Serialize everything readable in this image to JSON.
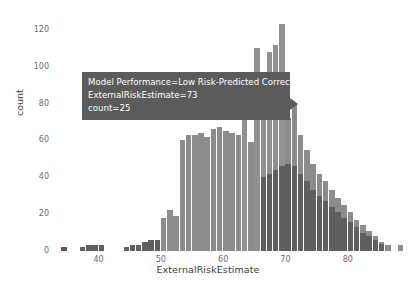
{
  "chart_data": {
    "type": "bar",
    "subtype": "overlapping-histogram",
    "title": "",
    "xlabel": "ExternalRiskEstimate",
    "ylabel": "count",
    "xlim": [
      33,
      90
    ],
    "ylim": [
      0,
      128
    ],
    "xticks": [
      40,
      50,
      60,
      70,
      80
    ],
    "yticks": [
      0,
      20,
      40,
      60,
      80,
      100,
      120
    ],
    "grid": false,
    "legend_position": "none",
    "bin_width": 1,
    "x": [
      34,
      35,
      36,
      37,
      38,
      39,
      40,
      41,
      42,
      43,
      44,
      45,
      46,
      47,
      48,
      49,
      50,
      51,
      52,
      53,
      54,
      55,
      56,
      57,
      58,
      59,
      60,
      61,
      62,
      63,
      64,
      65,
      66,
      67,
      68,
      69,
      70,
      71,
      72,
      73,
      74,
      75,
      76,
      77,
      78,
      79,
      80,
      81,
      82,
      83,
      84,
      85,
      86,
      87,
      88
    ],
    "series": [
      {
        "name": "Low Risk-Predicted Correctly",
        "color": "#8a8a8a",
        "values": [
          0,
          0,
          0,
          0,
          0,
          0,
          0,
          0,
          0,
          0,
          0,
          0,
          0,
          0,
          0,
          0,
          0,
          0,
          0,
          0,
          0,
          1,
          1,
          2,
          2,
          3,
          4,
          5,
          7,
          9,
          12,
          16,
          20,
          26,
          34,
          43,
          57,
          72,
          88,
          112,
          95,
          88,
          74,
          66,
          58,
          50,
          44,
          38,
          31,
          25,
          18,
          12,
          8,
          3,
          1
        ]
      },
      {
        "name": "High Risk-Predicted Correctly",
        "color": "#646464",
        "values": [
          1,
          0,
          0,
          1,
          1,
          2,
          2,
          1,
          1,
          1,
          2,
          2,
          2,
          4,
          5,
          8,
          12,
          14,
          16,
          22,
          60,
          62,
          63,
          64,
          62,
          65,
          66,
          65,
          64,
          62,
          60,
          58,
          57,
          58,
          55,
          52,
          50,
          46,
          40,
          35,
          30,
          26,
          22,
          18,
          15,
          12,
          10,
          8,
          6,
          4,
          3,
          2,
          1,
          1,
          2
        ]
      }
    ],
    "bars_rendered": [
      {
        "x": 34,
        "h": 2,
        "shade": "dark"
      },
      {
        "x": 37,
        "h": 2,
        "shade": "dark"
      },
      {
        "x": 38,
        "h": 3,
        "shade": "dark"
      },
      {
        "x": 39,
        "h": 3,
        "shade": "dark"
      },
      {
        "x": 40,
        "h": 3,
        "shade": "dark"
      },
      {
        "x": 44,
        "h": 2,
        "shade": "dark"
      },
      {
        "x": 45,
        "h": 3,
        "shade": "dark"
      },
      {
        "x": 46,
        "h": 3,
        "shade": "dark"
      },
      {
        "x": 47,
        "h": 5,
        "shade": "dark"
      },
      {
        "x": 48,
        "h": 6,
        "shade": "dark"
      },
      {
        "x": 49,
        "h": 6,
        "shade": "dark"
      },
      {
        "x": 50,
        "h": 6,
        "shade": "dark"
      },
      {
        "x": 51,
        "h": 8,
        "shade": "dark"
      },
      {
        "x": 52,
        "h": 6,
        "shade": "dark"
      },
      {
        "x": 53,
        "h": 6,
        "shade": "dark"
      },
      {
        "x": 54,
        "h": 7,
        "shade": "dark"
      },
      {
        "x": 55,
        "h": 8,
        "shade": "dark"
      },
      {
        "x": 56,
        "h": 9,
        "shade": "dark"
      },
      {
        "x": 57,
        "h": 10,
        "shade": "dark"
      },
      {
        "x": 58,
        "h": 12,
        "shade": "dark"
      },
      {
        "x": 50,
        "h": 18,
        "shade": "mid"
      },
      {
        "x": 51,
        "h": 22,
        "shade": "mid"
      },
      {
        "x": 52,
        "h": 19,
        "shade": "mid"
      },
      {
        "x": 53,
        "h": 60,
        "shade": "mid"
      },
      {
        "x": 54,
        "h": 63,
        "shade": "mid"
      },
      {
        "x": 55,
        "h": 63,
        "shade": "mid"
      },
      {
        "x": 56,
        "h": 64,
        "shade": "mid"
      },
      {
        "x": 57,
        "h": 62,
        "shade": "mid"
      },
      {
        "x": 58,
        "h": 66,
        "shade": "mid"
      },
      {
        "x": 59,
        "h": 67,
        "shade": "mid"
      },
      {
        "x": 60,
        "h": 65,
        "shade": "mid"
      },
      {
        "x": 61,
        "h": 64,
        "shade": "mid"
      },
      {
        "x": 62,
        "h": 63,
        "shade": "mid"
      },
      {
        "x": 63,
        "h": 61,
        "shade": "mid"
      },
      {
        "x": 64,
        "h": 59,
        "shade": "mid"
      },
      {
        "x": 65,
        "h": 58,
        "shade": "mid"
      },
      {
        "x": 66,
        "h": 59,
        "shade": "mid"
      },
      {
        "x": 67,
        "h": 62,
        "shade": "mid"
      },
      {
        "x": 68,
        "h": 74,
        "shade": "mid"
      },
      {
        "x": 69,
        "h": 68,
        "shade": "mid"
      },
      {
        "x": 70,
        "h": 72,
        "shade": "mid"
      },
      {
        "x": 71,
        "h": 80,
        "shade": "mid"
      },
      {
        "x": 72,
        "h": 63,
        "shade": "mid"
      },
      {
        "x": 73,
        "h": 55,
        "shade": "mid"
      },
      {
        "x": 74,
        "h": 47,
        "shade": "mid"
      },
      {
        "x": 75,
        "h": 42,
        "shade": "mid"
      },
      {
        "x": 76,
        "h": 38,
        "shade": "mid"
      },
      {
        "x": 77,
        "h": 33,
        "shade": "mid"
      },
      {
        "x": 78,
        "h": 29,
        "shade": "mid"
      },
      {
        "x": 79,
        "h": 25,
        "shade": "mid"
      },
      {
        "x": 80,
        "h": 21,
        "shade": "mid"
      },
      {
        "x": 81,
        "h": 17,
        "shade": "mid"
      },
      {
        "x": 82,
        "h": 14,
        "shade": "mid"
      },
      {
        "x": 83,
        "h": 11,
        "shade": "mid"
      },
      {
        "x": 84,
        "h": 8,
        "shade": "mid"
      },
      {
        "x": 85,
        "h": 5,
        "shade": "mid"
      },
      {
        "x": 86,
        "h": 3,
        "shade": "mid"
      },
      {
        "x": 88,
        "h": 3,
        "shade": "mid"
      },
      {
        "x": 63,
        "h": 95,
        "shade": "peak"
      },
      {
        "x": 65,
        "h": 110,
        "shade": "peak"
      },
      {
        "x": 66,
        "h": 76,
        "shade": "peak"
      },
      {
        "x": 67,
        "h": 108,
        "shade": "peak"
      },
      {
        "x": 68,
        "h": 112,
        "shade": "peak"
      },
      {
        "x": 69,
        "h": 123,
        "shade": "peak"
      },
      {
        "x": 66,
        "h": 40,
        "shade": "dark"
      },
      {
        "x": 67,
        "h": 42,
        "shade": "dark"
      },
      {
        "x": 68,
        "h": 44,
        "shade": "dark"
      },
      {
        "x": 69,
        "h": 46,
        "shade": "dark"
      },
      {
        "x": 70,
        "h": 47,
        "shade": "dark"
      },
      {
        "x": 71,
        "h": 46,
        "shade": "dark"
      },
      {
        "x": 72,
        "h": 42,
        "shade": "dark"
      },
      {
        "x": 73,
        "h": 38,
        "shade": "dark"
      },
      {
        "x": 74,
        "h": 33,
        "shade": "dark"
      },
      {
        "x": 75,
        "h": 30,
        "shade": "dark"
      },
      {
        "x": 76,
        "h": 27,
        "shade": "dark"
      },
      {
        "x": 77,
        "h": 24,
        "shade": "dark"
      },
      {
        "x": 78,
        "h": 21,
        "shade": "dark"
      },
      {
        "x": 79,
        "h": 18,
        "shade": "dark"
      },
      {
        "x": 80,
        "h": 16,
        "shade": "dark"
      },
      {
        "x": 81,
        "h": 13,
        "shade": "dark"
      },
      {
        "x": 82,
        "h": 10,
        "shade": "dark"
      },
      {
        "x": 83,
        "h": 8,
        "shade": "dark"
      },
      {
        "x": 84,
        "h": 6,
        "shade": "dark"
      },
      {
        "x": 85,
        "h": 4,
        "shade": "dark"
      }
    ]
  },
  "axes": {
    "x_label": "ExternalRiskEstimate",
    "y_label": "count",
    "x_tick_labels": [
      "40",
      "50",
      "60",
      "70",
      "80"
    ],
    "y_tick_labels": [
      "0",
      "20",
      "40",
      "60",
      "80",
      "100",
      "120"
    ]
  },
  "tooltip": {
    "line1": "Model Performance=Low Risk-Predicted Correctly",
    "line2": "ExternalRiskEstimate=73",
    "line3": "count=25",
    "background": "#5b5b5b",
    "text_color": "#ffffff"
  },
  "colors": {
    "background": "#ffffff",
    "bar_mid": "#8c8c8c",
    "bar_dark": "#5f5f5f",
    "bar_peak": "#919191",
    "tick_text": "#6a6a6a",
    "axis_title": "#3a3a3a"
  }
}
